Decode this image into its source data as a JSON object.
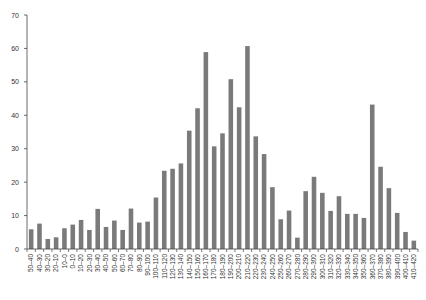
{
  "chart_data": {
    "type": "bar",
    "title": "",
    "xlabel": "",
    "ylabel": "",
    "ylim": [
      0,
      70
    ],
    "yticks": [
      0,
      10,
      20,
      30,
      40,
      50,
      60,
      70
    ],
    "grid": false,
    "legend": null,
    "bar_color": "#7a7a7a",
    "categories": [
      "50–40",
      "40–30",
      "30–20",
      "20–10",
      "10–0",
      "0–10",
      "10–20",
      "20–30",
      "30–40",
      "40–50",
      "50–60",
      "60–70",
      "70–80",
      "80–90",
      "90–100",
      "100–110",
      "110–120",
      "120–130",
      "130–140",
      "140–150",
      "150–160",
      "160–170",
      "170–180",
      "180–190",
      "190–200",
      "200–210",
      "210–220",
      "220–230",
      "230–240",
      "240–250",
      "250–260",
      "260–270",
      "270–280",
      "280–290",
      "290–300",
      "300–310",
      "310–320",
      "320–330",
      "330–340",
      "340–350",
      "350–360",
      "360–370",
      "370–380",
      "380–390",
      "390–400",
      "400–410",
      "410–420"
    ],
    "values": [
      5.9,
      7.6,
      3.0,
      3.5,
      6.2,
      7.3,
      8.7,
      5.7,
      12.0,
      6.6,
      8.5,
      5.7,
      12.1,
      7.9,
      8.2,
      15.4,
      23.4,
      24.0,
      25.6,
      35.4,
      42.1,
      58.9,
      30.7,
      34.6,
      50.8,
      42.4,
      60.7,
      33.7,
      28.4,
      18.5,
      8.9,
      11.5,
      3.4,
      17.3,
      21.6,
      16.8,
      11.4,
      15.8,
      10.5,
      10.5,
      9.3,
      43.2,
      24.6,
      18.2,
      10.8,
      5.1,
      2.5
    ]
  }
}
